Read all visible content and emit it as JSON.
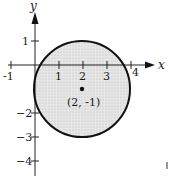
{
  "figure": {
    "x_axis_label": "x",
    "y_axis_label": "y",
    "x_ticks": [
      {
        "value": -1,
        "label": "-1"
      },
      {
        "value": 1,
        "label": "1"
      },
      {
        "value": 2,
        "label": "2"
      },
      {
        "value": 3,
        "label": "3"
      },
      {
        "value": 4,
        "label": "4"
      }
    ],
    "y_ticks": [
      {
        "value": 1,
        "label": "1"
      },
      {
        "value": -2,
        "label": "−2"
      },
      {
        "value": -3,
        "label": "−3"
      },
      {
        "value": -4,
        "label": "−4"
      }
    ],
    "circle": {
      "center_x": 2,
      "center_y": -1,
      "radius": 2,
      "fill_color": "#e4e4e4",
      "stroke_color": "#111111"
    },
    "center_label": "(2, -1)"
  }
}
